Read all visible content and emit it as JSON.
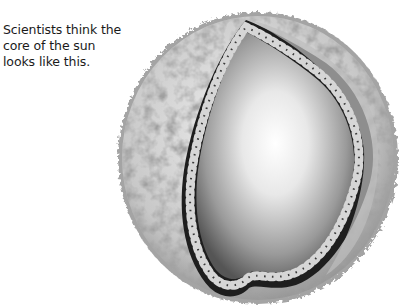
{
  "caption": {
    "lines": [
      "Scientists think the",
      "core of the sun",
      "looks like this."
    ]
  },
  "illustration": {
    "subject": "cutaway-sun-core",
    "colors": {
      "surface_light": "#e4e4e4",
      "surface_dark": "#6a6a6a",
      "cut_edge": "#1e1e1e",
      "core_center": "#ffffff",
      "core_edge": "#5a5a5a",
      "spiral_light": "#d8d8d8"
    }
  }
}
